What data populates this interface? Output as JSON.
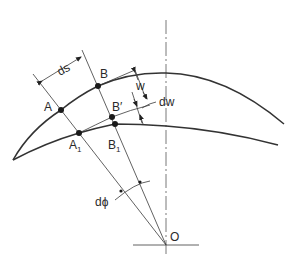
{
  "figure": {
    "labels": {
      "A": "A",
      "A1_base": "A",
      "A1_sub": "1",
      "B": "B",
      "B_prime": "B′",
      "B1_base": "B",
      "B1_sub": "1",
      "O": "O",
      "ds": "ds",
      "w": "w",
      "dw": "dw",
      "dphi": "dϕ"
    },
    "colors": {
      "line": "#333333",
      "background": "#ffffff"
    }
  }
}
